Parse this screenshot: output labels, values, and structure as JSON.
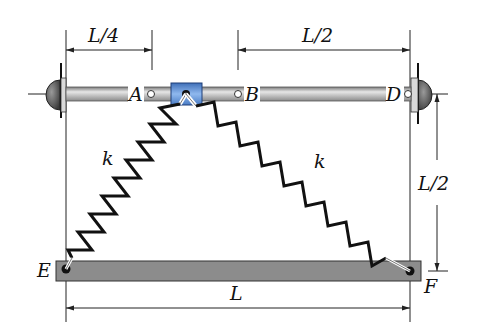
{
  "figure": {
    "labels": {
      "A": "A",
      "B": "B",
      "D": "D",
      "E": "E",
      "F": "F",
      "k_left": "k",
      "k_right": "k"
    },
    "dimensions": {
      "top_left": "L/4",
      "top_right": "L/2",
      "right_vertical": "L/2",
      "bottom": "L"
    },
    "colors": {
      "rod": "#b8b8b8",
      "collar": "#6f9fd8",
      "beam": "#8c8c8c",
      "spring": "#111111",
      "support": "#555555"
    }
  }
}
